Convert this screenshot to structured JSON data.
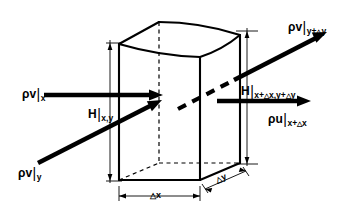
{
  "figure": {
    "type": "diagram",
    "background_color": "#ffffff",
    "line_color": "#000000"
  },
  "labels": {
    "inflow_x": {
      "name": "rho-v-at-x",
      "base": "ρv",
      "bar": "|",
      "sub": "x",
      "full": "ρv|x"
    },
    "head_xy": {
      "name": "head-at-x-y",
      "base": "H",
      "bar": "|",
      "sub": "x,y",
      "full": "H|x,y"
    },
    "inflow_y": {
      "name": "rho-v-at-y",
      "base": "ρv",
      "bar": "|",
      "sub": "y",
      "full": "ρv|y"
    },
    "outflow_ydy": {
      "name": "rho-v-at-y-plus-delta-y",
      "base": "ρv",
      "bar": "|",
      "sub_a": "y+",
      "tri": "△",
      "sub_b": "y",
      "full": "ρv|y+Δy"
    },
    "head_xdx_ydy": {
      "name": "head-at-x-plus-delta-x-y-plus-delta-y",
      "base": "H",
      "bar": "|",
      "sub_a": "x+",
      "tri_a": "△",
      "sub_b": "x,y+",
      "tri_b": "△",
      "sub_c": "y",
      "full": "H|x+Δx,y+Δy"
    },
    "outflow_xdx": {
      "name": "rho-u-at-x-plus-delta-x",
      "base": "ρu",
      "bar": "|",
      "sub_a": "x+",
      "tri": "△",
      "sub_b": "x",
      "full": "ρu|x+Δx"
    },
    "dim_dx": {
      "name": "dimension-delta-x",
      "tri": "△",
      "text": "x",
      "full": "Δx"
    },
    "dim_dy": {
      "name": "dimension-delta-y",
      "tri": "△",
      "text": "y",
      "full": "Δy"
    }
  }
}
